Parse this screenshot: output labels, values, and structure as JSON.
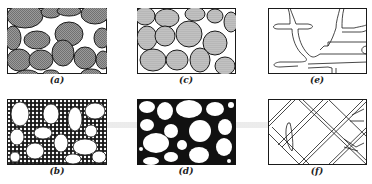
{
  "figure": {
    "panels": [
      {
        "id": "a",
        "label": "(a)",
        "description": "grains touching, hatched fill, little pore space"
      },
      {
        "id": "b",
        "label": "(b)",
        "description": "large white grains in fine-grained network matrix"
      },
      {
        "id": "c",
        "label": "(c)",
        "description": "grains touching, dotted fill"
      },
      {
        "id": "d",
        "label": "(d)",
        "description": "white grains in solid black matrix"
      },
      {
        "id": "e",
        "label": "(e)",
        "description": "sparse branching fracture/channel network"
      },
      {
        "id": "f",
        "label": "(f)",
        "description": "dense diagonal crossing fracture network"
      }
    ],
    "colors": {
      "ink": "#1a1a1a",
      "grain_fill": "#8a8a8a",
      "background": "#ffffff"
    }
  }
}
